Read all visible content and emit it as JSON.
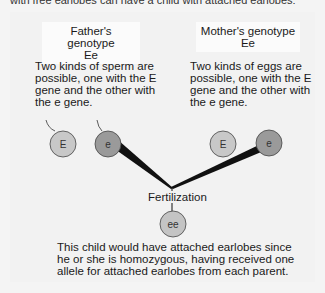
{
  "header": {
    "clipped_text": "with free earlobes can have a child with attached earlobes:"
  },
  "father": {
    "title": "Father's genotype",
    "genotype": "Ee",
    "description": [
      "Two kinds of sperm are",
      "possible, one with the E",
      "gene and the other with",
      "the e gene."
    ],
    "gametes": [
      {
        "label": "E",
        "color": "#c8c8c8"
      },
      {
        "label": "e",
        "color": "#9a9a9a"
      }
    ]
  },
  "mother": {
    "title": "Mother's genotype",
    "genotype": "Ee",
    "description": [
      "Two kinds of eggs are",
      "possible, one with the E",
      "gene and the other with",
      "the e gene."
    ],
    "gametes": [
      {
        "label": "E",
        "color": "#c8c8c8"
      },
      {
        "label": "e",
        "color": "#9a9a9a"
      }
    ]
  },
  "fertilization": {
    "label": "Fertilization"
  },
  "child": {
    "genotype": "ee",
    "color": "#c4c4c4",
    "description": [
      "This child would have attached earlobes since",
      "he or she is homozygous, having received one",
      "allele for attached earlobes from each parent."
    ]
  }
}
